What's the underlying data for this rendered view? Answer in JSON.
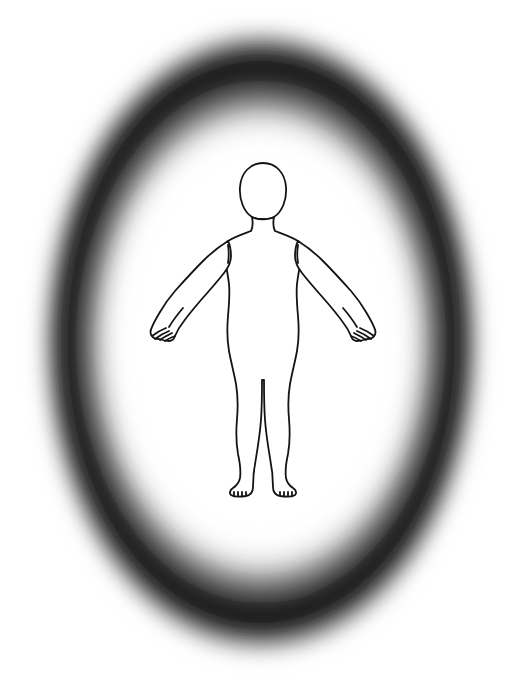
{
  "canvas": {
    "width": 521,
    "height": 684,
    "background_color": "#ffffff",
    "title": "Human Body Outline Diagram"
  },
  "vignette": {
    "name": "elliptical-vignette-ring",
    "shape": "ellipse",
    "center_x": 261,
    "center_y": 342,
    "radius_x": 224,
    "radius_y": 318,
    "band_color": "#1a1a1a",
    "peak_color": "#111111",
    "fade_color": "#ffffff",
    "inner_clear_radius_ratio": 0.74,
    "outer_fade_radius_ratio": 1.0,
    "darkest_radius_ratio": 0.88,
    "blur_px": 18,
    "description": "Soft blurred dark elliptical ring fading to white both inward and outward"
  },
  "figure": {
    "name": "human-body-outline",
    "view": "anterior",
    "pose": "standing, arms extended downward and outward, legs together",
    "stroke_color": "#141414",
    "fill_color": "#ffffff",
    "stroke_width": 1.8,
    "bounds": {
      "left": 150,
      "right": 375,
      "top": 163,
      "bottom": 498
    },
    "parts": [
      {
        "name": "head",
        "center_x": 263,
        "center_y": 191,
        "width": 44,
        "height": 57,
        "shape": "oval"
      },
      {
        "name": "neck",
        "center_x": 263,
        "top": 215,
        "bottom": 232,
        "width": 20
      },
      {
        "name": "shoulders",
        "center_y": 238,
        "span_left": 222,
        "span_right": 305
      },
      {
        "name": "torso",
        "top": 232,
        "bottom": 355,
        "left": 222,
        "right": 306
      },
      {
        "name": "left-arm",
        "shoulder_x": 226,
        "hand_x": 155,
        "hand_y": 338
      },
      {
        "name": "right-arm",
        "shoulder_x": 300,
        "hand_x": 370,
        "hand_y": 338
      },
      {
        "name": "left-hand",
        "center_x": 163,
        "center_y": 333,
        "fingers": 4
      },
      {
        "name": "right-hand",
        "center_x": 362,
        "center_y": 333,
        "fingers": 4
      },
      {
        "name": "left-leg",
        "hip_x": 240,
        "foot_x": 242,
        "foot_y": 492
      },
      {
        "name": "right-leg",
        "hip_x": 286,
        "foot_x": 285,
        "foot_y": 492
      },
      {
        "name": "left-foot",
        "center_x": 241,
        "center_y": 488,
        "toes": 5
      },
      {
        "name": "right-foot",
        "center_x": 286,
        "center_y": 488,
        "toes": 5
      },
      {
        "name": "crotch",
        "x": 263,
        "y": 358
      }
    ]
  }
}
